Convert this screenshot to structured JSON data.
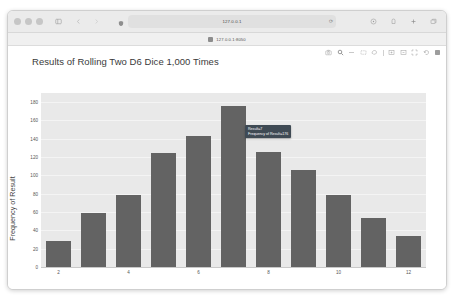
{
  "browser": {
    "window_controls": [
      "close",
      "minimize",
      "maximize"
    ],
    "sidebar_icon": "sidebar-icon",
    "back_icon": "chevron-left-icon",
    "forward_icon": "chevron-right-icon",
    "shield_icon": "shield-icon",
    "url": "127.0.0.1",
    "reload_icon": "reload-icon",
    "share_icon": "share-icon",
    "download_icon": "download-icon",
    "new_tab_icon": "plus-icon",
    "tab_overview_icon": "tab-overview-icon",
    "bookmark": {
      "favicon": "page-icon",
      "label": "127.0.0.1:8050"
    }
  },
  "modebar": {
    "items": [
      "camera-icon",
      "zoom-icon",
      "pan-icon",
      "box-select-icon",
      "lasso-select-icon",
      "zoom-in-icon",
      "zoom-out-icon",
      "autoscale-icon",
      "reset-axes-icon",
      "plotly-logo-icon"
    ]
  },
  "tooltip": {
    "line1": "Result=7",
    "line2": "Frequency of Result=176"
  },
  "chart_data": {
    "type": "bar",
    "title": "Results of Rolling Two D6 Dice 1,000 Times",
    "xlabel": "Result",
    "ylabel": "Frequency of Result",
    "categories": [
      2,
      3,
      4,
      5,
      6,
      7,
      8,
      9,
      10,
      11,
      12
    ],
    "values": [
      28,
      59,
      79,
      124,
      143,
      176,
      126,
      106,
      79,
      54,
      34
    ],
    "xticks": [
      2,
      4,
      6,
      8,
      10,
      12
    ],
    "yticks": [
      0,
      20,
      40,
      60,
      80,
      100,
      120,
      140,
      160,
      180
    ],
    "ylim": [
      0,
      190
    ],
    "grid": true,
    "legend": false,
    "bar_color": "#636363",
    "plot_bgcolor": "#e9e9e9",
    "paper_bgcolor": "#ffffff"
  }
}
